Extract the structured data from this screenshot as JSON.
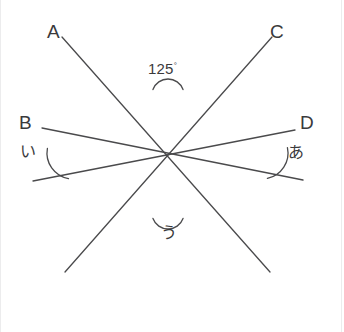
{
  "figure": {
    "type": "geometry-diagram",
    "background_color": "#ffffff",
    "line_color": "#4a4a4c",
    "text_color": "#3a3a3c",
    "line_width": 1.3,
    "border_color": "#ececed",
    "point_labels": [
      {
        "id": "A",
        "text": "A",
        "x": 47,
        "y": 22
      },
      {
        "id": "C",
        "text": "C",
        "x": 270,
        "y": 22
      },
      {
        "id": "B",
        "text": "B",
        "x": 19,
        "y": 113
      },
      {
        "id": "D",
        "text": "D",
        "x": 300,
        "y": 113
      }
    ],
    "angle_labels": [
      {
        "id": "top",
        "text": "125",
        "unit": "°",
        "x": 148,
        "y": 61
      },
      {
        "id": "left",
        "text": "い",
        "x": 20,
        "y": 144
      },
      {
        "id": "right",
        "text": "あ",
        "x": 288,
        "y": 145
      },
      {
        "id": "bottom",
        "text": "う",
        "x": 161,
        "y": 225
      }
    ],
    "intersections": [
      {
        "id": "top",
        "x": 168,
        "y": 95,
        "angle_mark": "125"
      },
      {
        "id": "left",
        "x": 73,
        "y": 153,
        "angle_mark": "い"
      },
      {
        "id": "right",
        "x": 262,
        "y": 153,
        "angle_mark": "あ"
      },
      {
        "id": "bottom",
        "x": 168,
        "y": 213,
        "angle_mark": "う"
      }
    ],
    "lines": [
      {
        "id": "line-A-to-bottom-right",
        "from_label": "A",
        "x1": 62,
        "y1": 37,
        "x2": 270,
        "y2": 272
      },
      {
        "id": "line-C-to-bottom-left",
        "from_label": "C",
        "x1": 272,
        "y1": 37,
        "x2": 65,
        "y2": 272
      },
      {
        "id": "line-B-to-right",
        "from_label": "B",
        "x1": 42,
        "y1": 128,
        "x2": 303,
        "y2": 180
      },
      {
        "id": "line-D-to-left",
        "from_label": "D",
        "x1": 295,
        "y1": 130,
        "x2": 33,
        "y2": 181
      }
    ],
    "arcs": [
      {
        "id": "arc-top",
        "cx": 168,
        "cy": 95,
        "r": 16,
        "start_deg": 200,
        "end_deg": 340
      },
      {
        "id": "arc-left",
        "cx": 73,
        "cy": 153,
        "r": 26,
        "start_deg": 100,
        "end_deg": 190
      },
      {
        "id": "arc-right",
        "cx": 262,
        "cy": 153,
        "r": 26,
        "start_deg": 348,
        "end_deg": 78
      },
      {
        "id": "arc-bottom",
        "cx": 168,
        "cy": 213,
        "r": 16,
        "start_deg": 20,
        "end_deg": 160
      }
    ]
  }
}
